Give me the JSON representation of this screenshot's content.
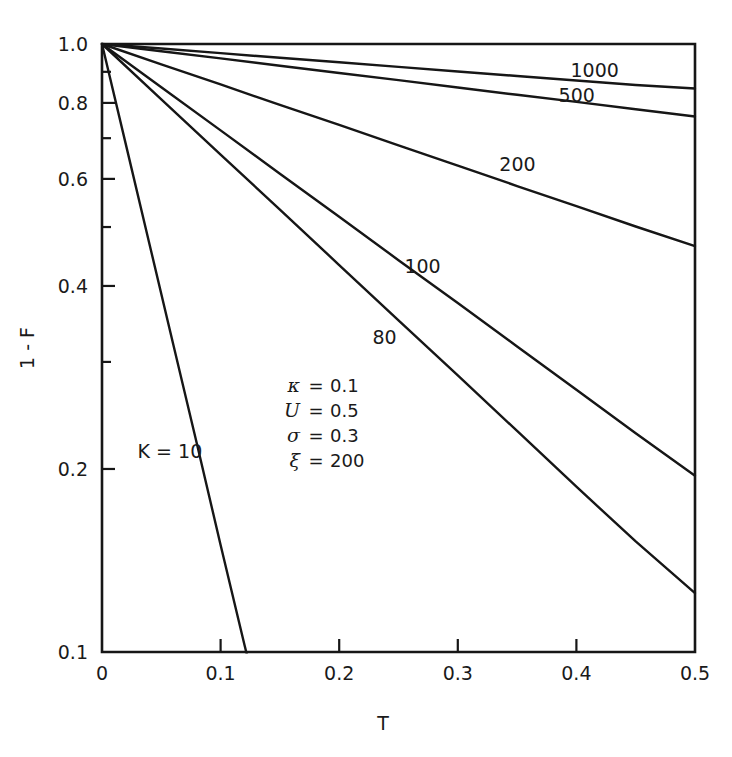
{
  "chart_data": {
    "type": "line",
    "title": "",
    "xlabel": "T",
    "ylabel": "1 - F",
    "xlim": [
      0,
      0.5
    ],
    "ylim": [
      0.1,
      1.0
    ],
    "yscale": "log",
    "xscale": "linear",
    "grid": false,
    "legend_position": "inline-curve-labels",
    "xticks": [
      0,
      0.1,
      0.2,
      0.3,
      0.4,
      0.5
    ],
    "xticklabels": [
      "0",
      "0.1",
      "0.2",
      "0.3",
      "0.4",
      "0.5"
    ],
    "yticks": [
      1.0,
      0.9,
      0.8,
      0.7,
      0.6,
      0.5,
      0.4,
      0.3,
      0.2,
      0.1
    ],
    "yticklabels_major": [
      "1.0",
      "0.8",
      "0.6",
      "0.4",
      "0.2",
      "0.1"
    ],
    "ytick_major_values": [
      1.0,
      0.8,
      0.6,
      0.4,
      0.2,
      0.1
    ],
    "ytick_minor_values": [
      0.9,
      0.7,
      0.5,
      0.3
    ],
    "series": [
      {
        "name": "1000",
        "label": "1000",
        "K": 1000,
        "x": [
          0,
          0.05,
          0.1,
          0.15,
          0.2,
          0.25,
          0.3,
          0.35,
          0.4,
          0.45,
          0.5
        ],
        "values": [
          1.0,
          0.983,
          0.966,
          0.949,
          0.933,
          0.917,
          0.901,
          0.886,
          0.871,
          0.856,
          0.845
        ]
      },
      {
        "name": "500",
        "label": "500",
        "K": 500,
        "x": [
          0,
          0.05,
          0.1,
          0.15,
          0.2,
          0.25,
          0.3,
          0.35,
          0.4,
          0.45,
          0.5
        ],
        "values": [
          1.0,
          0.973,
          0.947,
          0.921,
          0.896,
          0.872,
          0.848,
          0.825,
          0.803,
          0.781,
          0.76
        ]
      },
      {
        "name": "200",
        "label": "200",
        "K": 200,
        "x": [
          0,
          0.05,
          0.1,
          0.15,
          0.2,
          0.25,
          0.3,
          0.35,
          0.4,
          0.45,
          0.5
        ],
        "values": [
          1.0,
          0.926,
          0.858,
          0.794,
          0.736,
          0.681,
          0.631,
          0.584,
          0.541,
          0.501,
          0.465
        ]
      },
      {
        "name": "100",
        "label": "100",
        "K": 100,
        "x": [
          0,
          0.05,
          0.1,
          0.15,
          0.2,
          0.25,
          0.3,
          0.35,
          0.4,
          0.45,
          0.5
        ],
        "values": [
          1.0,
          0.849,
          0.721,
          0.612,
          0.52,
          0.441,
          0.375,
          0.318,
          0.27,
          0.229,
          0.195
        ]
      },
      {
        "name": "80",
        "label": "80",
        "K": 80,
        "x": [
          0,
          0.05,
          0.1,
          0.15,
          0.2,
          0.25,
          0.3,
          0.35,
          0.4,
          0.45,
          0.5
        ],
        "values": [
          1.0,
          0.811,
          0.658,
          0.534,
          0.433,
          0.351,
          0.285,
          0.231,
          0.187,
          0.152,
          0.125
        ]
      },
      {
        "name": "K = 10",
        "label": "K = 10",
        "K": 10,
        "x": [
          0,
          0.02,
          0.04,
          0.06,
          0.08,
          0.1,
          0.12,
          0.125
        ],
        "values": [
          1.0,
          0.685,
          0.469,
          0.321,
          0.22,
          0.15,
          0.103,
          0.094
        ]
      }
    ],
    "annotations": {
      "parameters": [
        {
          "symbol": "κ",
          "equals": "=",
          "value": "0.1"
        },
        {
          "symbol": "U",
          "equals": "=",
          "value": "0.5"
        },
        {
          "symbol": "σ",
          "equals": "=",
          "value": "0.3"
        },
        {
          "symbol": "ξ",
          "equals": "=",
          "value": "200"
        }
      ]
    },
    "curve_labels": [
      {
        "text": "1000",
        "x": 0.395,
        "y": 0.905
      },
      {
        "text": "500",
        "x": 0.385,
        "y": 0.825
      },
      {
        "text": "200",
        "x": 0.335,
        "y": 0.635
      },
      {
        "text": "100",
        "x": 0.255,
        "y": 0.432
      },
      {
        "text": "80",
        "x": 0.228,
        "y": 0.33
      },
      {
        "text": "K = 10",
        "x": 0.03,
        "y": 0.214
      }
    ],
    "line_color": "#161616",
    "background_color": "#ffffff"
  }
}
